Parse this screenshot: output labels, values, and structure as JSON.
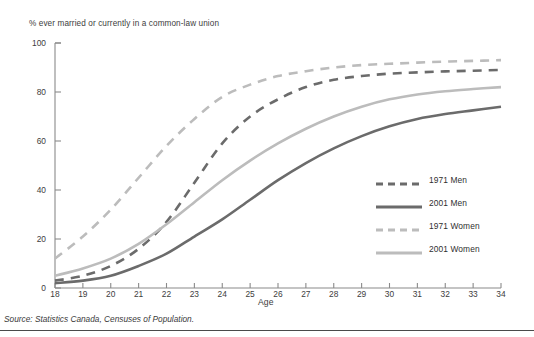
{
  "chart_data": {
    "type": "line",
    "title": "",
    "ylabel": "% ever married or currently in a common-law union",
    "xlabel": "Age",
    "xlim": [
      18,
      34
    ],
    "ylim": [
      0,
      100
    ],
    "yticks": [
      0,
      20,
      40,
      60,
      80,
      100
    ],
    "xticks": [
      18,
      19,
      20,
      21,
      22,
      23,
      24,
      25,
      26,
      27,
      28,
      29,
      30,
      31,
      32,
      33,
      34
    ],
    "grid": false,
    "legend_position": "inside-right",
    "x": [
      18,
      19,
      20,
      21,
      22,
      23,
      24,
      25,
      26,
      27,
      28,
      29,
      30,
      31,
      32,
      33,
      34
    ],
    "series": [
      {
        "name": "1971 Men",
        "style": "dashed",
        "color": "#6b6b6b",
        "values": [
          3,
          5,
          9,
          16,
          27,
          43,
          59,
          70,
          77,
          82,
          85,
          86.5,
          87.5,
          88,
          88.4,
          88.7,
          89
        ]
      },
      {
        "name": "2001 Men",
        "style": "solid",
        "color": "#6b6b6b",
        "values": [
          2,
          3,
          5,
          9,
          14,
          21,
          28,
          36,
          44,
          51,
          57,
          62,
          66,
          69,
          71,
          72.5,
          74
        ]
      },
      {
        "name": "1971 Women",
        "style": "dashed",
        "color": "#bcbcbc",
        "values": [
          12,
          21,
          32,
          45,
          58,
          69,
          78,
          83,
          86.5,
          88.5,
          90,
          91,
          91.5,
          92,
          92.4,
          92.7,
          93
        ]
      },
      {
        "name": "2001 Women",
        "style": "solid",
        "color": "#bcbcbc",
        "values": [
          5,
          8,
          12,
          18,
          26,
          35,
          44,
          52,
          59,
          65,
          70,
          74,
          77,
          79,
          80.3,
          81.2,
          82
        ]
      }
    ]
  },
  "legend": {
    "items": [
      {
        "label": "1971 Men"
      },
      {
        "label": "2001 Men"
      },
      {
        "label": "1971 Women"
      },
      {
        "label": "2001 Women"
      }
    ]
  },
  "axes": {
    "y_title": "% ever married or currently in a common-law union",
    "x_title": "Age",
    "y_ticks": [
      "0",
      "20",
      "40",
      "60",
      "80",
      "100"
    ],
    "x_ticks": [
      "18",
      "19",
      "20",
      "21",
      "22",
      "23",
      "24",
      "25",
      "26",
      "27",
      "28",
      "29",
      "30",
      "31",
      "32",
      "33",
      "34"
    ]
  },
  "source": {
    "text": "Source: Statistics Canada, Censuses of Population."
  },
  "colors": {
    "dark_series": "#6b6b6b",
    "light_series": "#bcbcbc",
    "axis": "#8a8a8a",
    "text": "#3a3a3a"
  }
}
